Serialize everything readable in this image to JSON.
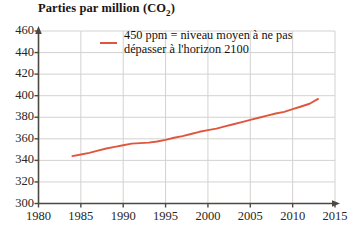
{
  "chart_data": {
    "type": "line",
    "title_main": "Parties par million (CO",
    "title_sub": "2",
    "title_end": ")",
    "xlabel": "",
    "ylabel": "",
    "xlim": [
      1980,
      2015
    ],
    "ylim": [
      300,
      460
    ],
    "grid": true,
    "legend_position": "top-center",
    "legend": [
      "450 ppm = niveau moyen à ne pas dépasser à l'horizon 2100"
    ],
    "legend_text": "450 ppm = niveau moyen à ne pas\ndépasser à l'horizon 2100",
    "series_color": "#e0563c",
    "xticks": [
      1980,
      1985,
      1990,
      1995,
      2000,
      2005,
      2010,
      2015
    ],
    "xtick_labels": [
      "1980",
      "1985",
      "1990",
      "1995",
      "2000",
      "2005",
      "2010",
      "2015"
    ],
    "yticks": [
      300,
      320,
      340,
      360,
      380,
      400,
      420,
      440,
      460
    ],
    "ytick_labels": [
      "300",
      "320",
      "340",
      "360",
      "380",
      "400",
      "420",
      "440",
      "460"
    ],
    "series": [
      {
        "name": "CO2 atmosphérique (ppm)",
        "x": [
          1984,
          1985,
          1986,
          1987,
          1988,
          1989,
          1990,
          1991,
          1992,
          1993,
          1994,
          1995,
          1996,
          1997,
          1998,
          1999,
          2000,
          2001,
          2002,
          2003,
          2004,
          2005,
          2006,
          2007,
          2008,
          2009,
          2010,
          2011,
          2012,
          2013
        ],
        "values": [
          344,
          345.5,
          347,
          349,
          351,
          352.5,
          354,
          355.5,
          356,
          356.5,
          357.5,
          359,
          361,
          362.5,
          364.5,
          366.5,
          368,
          369.5,
          371.5,
          373.5,
          375.5,
          377.5,
          379.5,
          381.5,
          383.5,
          385,
          387.5,
          390,
          392.5,
          397
        ]
      }
    ]
  },
  "axis": {
    "x_arrow": true,
    "y_arrow": true
  }
}
